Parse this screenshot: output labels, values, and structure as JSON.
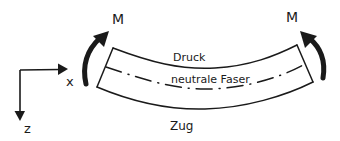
{
  "diagram": {
    "moment_left": {
      "label": "M"
    },
    "moment_right": {
      "label": "M"
    },
    "axes": {
      "x_label": "x",
      "z_label": "z"
    },
    "beam": {
      "top_label": "Druck",
      "middle_label": "neutrale Faser",
      "bottom_label": "Zug"
    },
    "colors": {
      "stroke": "#1a1a1a",
      "background": "#ffffff"
    }
  }
}
